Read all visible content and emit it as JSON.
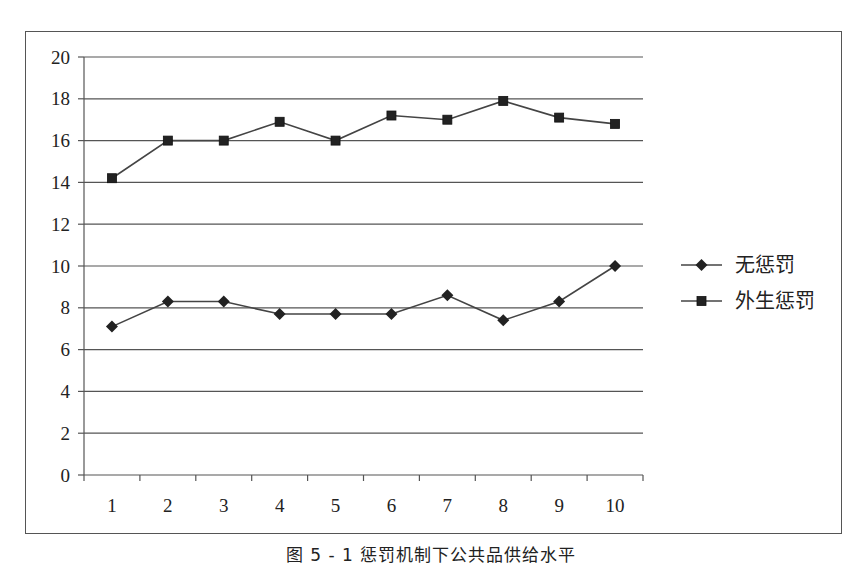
{
  "chart_data": {
    "type": "line",
    "title": "",
    "xlabel": "",
    "ylabel": "",
    "categories": [
      "1",
      "2",
      "3",
      "4",
      "5",
      "6",
      "7",
      "8",
      "9",
      "10"
    ],
    "x": [
      1,
      2,
      3,
      4,
      5,
      6,
      7,
      8,
      9,
      10
    ],
    "ylim": [
      0,
      20
    ],
    "yticks": [
      0,
      2,
      4,
      6,
      8,
      10,
      12,
      14,
      16,
      18,
      20
    ],
    "grid": true,
    "legend_position": "right",
    "series": [
      {
        "name": "无惩罚",
        "marker": "diamond",
        "color": "#222222",
        "values": [
          7.1,
          8.3,
          8.3,
          7.7,
          7.7,
          7.7,
          8.6,
          7.4,
          8.3,
          10.0
        ]
      },
      {
        "name": "外生惩罚",
        "marker": "square",
        "color": "#222222",
        "values": [
          14.2,
          16.0,
          16.0,
          16.9,
          16.0,
          17.2,
          17.0,
          17.9,
          17.1,
          16.8
        ]
      }
    ]
  },
  "caption": "图 5 - 1   惩罚机制下公共品供给水平",
  "colors": {
    "line": "#444444",
    "marker": "#222222",
    "grid": "#555555",
    "frame": "#555555"
  }
}
